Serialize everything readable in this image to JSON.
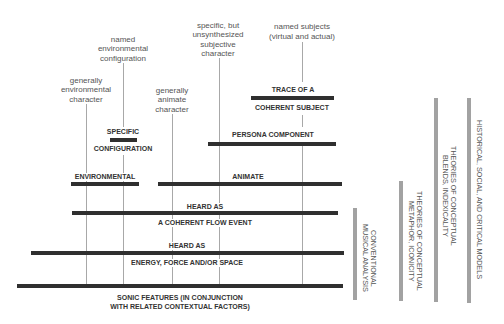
{
  "annotations": {
    "generally_environmental": "generally\nenvironmental\ncharacter",
    "named_environmental_configuration": "named\nenvironmental\nconfiguration",
    "generally_animate": "generally\nanimate\ncharacter",
    "specific_unsynthesized": "specific, but\nunsynthesized\nsubjective\ncharacter",
    "named_subjects": "named subjects\n(virtual and actual)"
  },
  "levels": {
    "specific_configuration": {
      "top": "SPECIFIC",
      "bottom": "CONFIGURATION"
    },
    "trace_of_subject": {
      "top": "TRACE OF A",
      "bottom": "COHERENT SUBJECT"
    },
    "persona_component": "PERSONA COMPONENT",
    "environmental": "ENVIRONMENTAL",
    "animate": "ANIMATE",
    "flow_event": {
      "top": "HEARD AS",
      "bottom": "A COHERENT FLOW EVENT"
    },
    "energy_force_space": {
      "top": "HEARD AS",
      "bottom": "ENERGY, FORCE AND/OR SPACE"
    },
    "sonic_features": "SONIC FEATURES (IN CONJUNCTION\nWITH RELATED CONTEXTUAL FACTORS)"
  },
  "methods": [
    "CONVENTIONAL\nMUSICAL ANALYSIS",
    "THEORIES OF CONCEPTUAL\nMETAPHOR, ICONICITY",
    "THEORIES OF CONCEPTUAL\nBLENDS, INDEXICALITY",
    "HISTORICAL, SOCIAL, AND CRITICAL MODELS"
  ],
  "colors": {
    "level_bar": "#2f2f2f",
    "method_bar": "#a2a2a2",
    "connector_line": "#a8a8a8",
    "annotation_text": "#555555",
    "label_text": "#333333"
  }
}
